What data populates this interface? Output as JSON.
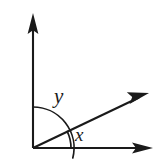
{
  "figure": {
    "background_color": "#ffffff",
    "stroke_color": "#1a1a1a",
    "labels": {
      "inner_angle": "x",
      "outer_angle": "y"
    },
    "geometry": {
      "vertex": {
        "x": 33,
        "y": 148
      },
      "rays": [
        {
          "name": "vertical-axis",
          "tip_x": 33,
          "tip_y": 14,
          "angle_deg": 90
        },
        {
          "name": "horizontal-axis",
          "tip_x": 152,
          "tip_y": 148,
          "angle_deg": 0
        },
        {
          "name": "diagonal-ray",
          "tip_x": 148,
          "tip_y": 93,
          "angle_deg": 26
        }
      ],
      "arcs": [
        {
          "name": "angle-x-arc",
          "label": "x",
          "radius": 38,
          "start_deg": 0,
          "end_deg": 26
        },
        {
          "name": "angle-y-arc",
          "label": "y",
          "radius": 41,
          "start_deg": 14,
          "end_deg": 90
        }
      ]
    }
  }
}
